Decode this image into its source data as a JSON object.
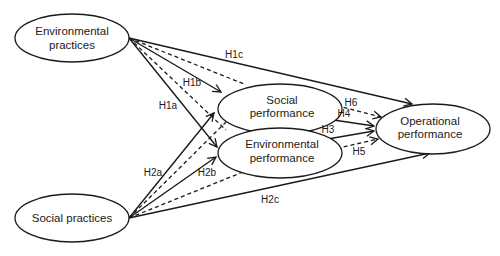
{
  "diagram": {
    "nodes": {
      "env_practices": {
        "line1": "Environmental",
        "line2": "practices"
      },
      "soc_practices": {
        "line1": "Social practices"
      },
      "soc_performance": {
        "line1": "Social",
        "line2": "performance"
      },
      "env_performance": {
        "line1": "Environmental",
        "line2": "performance"
      },
      "op_performance": {
        "line1": "Operational",
        "line2": "performance"
      }
    },
    "edges": {
      "h1a": {
        "label": "H1a",
        "from": "Environmental practices",
        "to": "Environmental performance",
        "style": "solid"
      },
      "h1b": {
        "label": "H1b",
        "from": "Environmental practices",
        "to": "Social performance",
        "style": "solid"
      },
      "h1c": {
        "label": "H1c",
        "from": "Environmental practices",
        "to": "Operational performance",
        "style": "solid"
      },
      "h2a": {
        "label": "H2a",
        "from": "Social practices",
        "to": "Social performance",
        "style": "solid"
      },
      "h2b": {
        "label": "H2b",
        "from": "Social practices",
        "to": "Environmental performance",
        "style": "solid"
      },
      "h2c": {
        "label": "H2c",
        "from": "Social practices",
        "to": "Operational performance",
        "style": "solid"
      },
      "h3": {
        "label": "H3",
        "from": "Environmental performance",
        "to": "Operational performance",
        "style": "solid"
      },
      "h4": {
        "label": "H4",
        "from": "Social performance",
        "to": "Operational performance",
        "style": "solid"
      },
      "h5": {
        "label": "H5",
        "from": "Environmental performance",
        "to": "Operational performance",
        "style": "dashed"
      },
      "h6": {
        "label": "H6",
        "from": "Social performance",
        "to": "Operational performance",
        "style": "dashed"
      }
    }
  }
}
